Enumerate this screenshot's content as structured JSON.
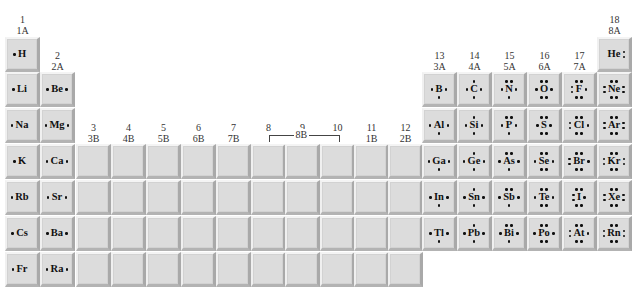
{
  "layout": {
    "col_x": [
      5,
      40,
      76,
      111,
      146,
      181,
      216,
      251,
      285,
      320,
      354,
      388,
      422,
      457,
      492,
      527,
      562,
      597
    ],
    "row_y": [
      37,
      72,
      108,
      144,
      180,
      216,
      252
    ],
    "tile_size": 35
  },
  "group_headers": [
    {
      "col": 0,
      "top": "1",
      "bottom": "1A",
      "y": 14
    },
    {
      "col": 1,
      "top": "2",
      "bottom": "2A",
      "y": 50
    },
    {
      "col": 2,
      "top": "3",
      "bottom": "3B",
      "y": 122
    },
    {
      "col": 3,
      "top": "4",
      "bottom": "4B",
      "y": 122
    },
    {
      "col": 4,
      "top": "5",
      "bottom": "5B",
      "y": 122
    },
    {
      "col": 5,
      "top": "6",
      "bottom": "6B",
      "y": 122
    },
    {
      "col": 6,
      "top": "7",
      "bottom": "7B",
      "y": 122
    },
    {
      "col": 7,
      "top": "8",
      "bottom": "",
      "y": 122
    },
    {
      "col": 8,
      "top": "9",
      "bottom": "",
      "y": 122
    },
    {
      "col": 9,
      "top": "10",
      "bottom": "",
      "y": 122
    },
    {
      "col": 10,
      "top": "11",
      "bottom": "1B",
      "y": 122
    },
    {
      "col": 11,
      "top": "12",
      "bottom": "2B",
      "y": 122
    },
    {
      "col": 12,
      "top": "13",
      "bottom": "3A",
      "y": 50
    },
    {
      "col": 13,
      "top": "14",
      "bottom": "4A",
      "y": 50
    },
    {
      "col": 14,
      "top": "15",
      "bottom": "5A",
      "y": 50
    },
    {
      "col": 15,
      "top": "16",
      "bottom": "6A",
      "y": 50
    },
    {
      "col": 16,
      "top": "17",
      "bottom": "7A",
      "y": 50
    },
    {
      "col": 17,
      "top": "18",
      "bottom": "8A",
      "y": 14
    }
  ],
  "group_8b_bracket": {
    "label": "8B",
    "from_col": 7,
    "to_col": 9
  },
  "elements": [
    {
      "symbol": "H",
      "col": 0,
      "row": 0,
      "dots": {
        "l": 1,
        "r": 0,
        "t": 0,
        "b": 0
      }
    },
    {
      "symbol": "He",
      "col": 17,
      "row": 0,
      "dots": {
        "l": 0,
        "r": 2,
        "t": 0,
        "b": 0
      }
    },
    {
      "symbol": "Li",
      "col": 0,
      "row": 1,
      "dots": {
        "l": 1,
        "r": 0,
        "t": 0,
        "b": 0
      }
    },
    {
      "symbol": "Be",
      "col": 1,
      "row": 1,
      "dots": {
        "l": 1,
        "r": 1,
        "t": 0,
        "b": 0
      }
    },
    {
      "symbol": "B",
      "col": 12,
      "row": 1,
      "dots": {
        "l": 1,
        "r": 1,
        "t": 0,
        "b": 1
      }
    },
    {
      "symbol": "C",
      "col": 13,
      "row": 1,
      "dots": {
        "l": 1,
        "r": 1,
        "t": 1,
        "b": 1
      }
    },
    {
      "symbol": "N",
      "col": 14,
      "row": 1,
      "dots": {
        "l": 1,
        "r": 1,
        "t": 2,
        "b": 1
      }
    },
    {
      "symbol": "O",
      "col": 15,
      "row": 1,
      "dots": {
        "l": 1,
        "r": 1,
        "t": 2,
        "b": 2
      }
    },
    {
      "symbol": "F",
      "col": 16,
      "row": 1,
      "dots": {
        "l": 2,
        "r": 1,
        "t": 2,
        "b": 2
      }
    },
    {
      "symbol": "Ne",
      "col": 17,
      "row": 1,
      "dots": {
        "l": 2,
        "r": 2,
        "t": 2,
        "b": 2
      }
    },
    {
      "symbol": "Na",
      "col": 0,
      "row": 2,
      "dots": {
        "l": 1,
        "r": 0,
        "t": 0,
        "b": 0
      }
    },
    {
      "symbol": "Mg",
      "col": 1,
      "row": 2,
      "dots": {
        "l": 1,
        "r": 1,
        "t": 0,
        "b": 0
      }
    },
    {
      "symbol": "Al",
      "col": 12,
      "row": 2,
      "dots": {
        "l": 1,
        "r": 1,
        "t": 0,
        "b": 1
      }
    },
    {
      "symbol": "Si",
      "col": 13,
      "row": 2,
      "dots": {
        "l": 1,
        "r": 1,
        "t": 1,
        "b": 1
      }
    },
    {
      "symbol": "P",
      "col": 14,
      "row": 2,
      "dots": {
        "l": 1,
        "r": 1,
        "t": 2,
        "b": 1
      }
    },
    {
      "symbol": "S",
      "col": 15,
      "row": 2,
      "dots": {
        "l": 1,
        "r": 1,
        "t": 2,
        "b": 2
      }
    },
    {
      "symbol": "Cl",
      "col": 16,
      "row": 2,
      "dots": {
        "l": 2,
        "r": 1,
        "t": 2,
        "b": 2
      }
    },
    {
      "symbol": "Ar",
      "col": 17,
      "row": 2,
      "dots": {
        "l": 2,
        "r": 2,
        "t": 2,
        "b": 2
      }
    },
    {
      "symbol": "K",
      "col": 0,
      "row": 3,
      "dots": {
        "l": 1,
        "r": 0,
        "t": 0,
        "b": 0
      }
    },
    {
      "symbol": "Ca",
      "col": 1,
      "row": 3,
      "dots": {
        "l": 1,
        "r": 1,
        "t": 0,
        "b": 0
      }
    },
    {
      "symbol": "Ga",
      "col": 12,
      "row": 3,
      "dots": {
        "l": 1,
        "r": 1,
        "t": 0,
        "b": 1
      }
    },
    {
      "symbol": "Ge",
      "col": 13,
      "row": 3,
      "dots": {
        "l": 1,
        "r": 1,
        "t": 1,
        "b": 1
      }
    },
    {
      "symbol": "As",
      "col": 14,
      "row": 3,
      "dots": {
        "l": 1,
        "r": 1,
        "t": 2,
        "b": 1
      }
    },
    {
      "symbol": "Se",
      "col": 15,
      "row": 3,
      "dots": {
        "l": 1,
        "r": 1,
        "t": 2,
        "b": 2
      }
    },
    {
      "symbol": "Br",
      "col": 16,
      "row": 3,
      "dots": {
        "l": 2,
        "r": 1,
        "t": 2,
        "b": 2
      }
    },
    {
      "symbol": "Kr",
      "col": 17,
      "row": 3,
      "dots": {
        "l": 2,
        "r": 2,
        "t": 2,
        "b": 2
      }
    },
    {
      "symbol": "Rb",
      "col": 0,
      "row": 4,
      "dots": {
        "l": 1,
        "r": 0,
        "t": 0,
        "b": 0
      }
    },
    {
      "symbol": "Sr",
      "col": 1,
      "row": 4,
      "dots": {
        "l": 1,
        "r": 1,
        "t": 0,
        "b": 0
      }
    },
    {
      "symbol": "In",
      "col": 12,
      "row": 4,
      "dots": {
        "l": 1,
        "r": 1,
        "t": 0,
        "b": 1
      }
    },
    {
      "symbol": "Sn",
      "col": 13,
      "row": 4,
      "dots": {
        "l": 1,
        "r": 1,
        "t": 1,
        "b": 1
      }
    },
    {
      "symbol": "Sb",
      "col": 14,
      "row": 4,
      "dots": {
        "l": 1,
        "r": 1,
        "t": 2,
        "b": 1
      }
    },
    {
      "symbol": "Te",
      "col": 15,
      "row": 4,
      "dots": {
        "l": 1,
        "r": 1,
        "t": 2,
        "b": 2
      }
    },
    {
      "symbol": "I",
      "col": 16,
      "row": 4,
      "dots": {
        "l": 2,
        "r": 1,
        "t": 2,
        "b": 2
      }
    },
    {
      "symbol": "Xe",
      "col": 17,
      "row": 4,
      "dots": {
        "l": 2,
        "r": 2,
        "t": 2,
        "b": 2
      }
    },
    {
      "symbol": "Cs",
      "col": 0,
      "row": 5,
      "dots": {
        "l": 1,
        "r": 0,
        "t": 0,
        "b": 0
      }
    },
    {
      "symbol": "Ba",
      "col": 1,
      "row": 5,
      "dots": {
        "l": 1,
        "r": 1,
        "t": 0,
        "b": 0
      }
    },
    {
      "symbol": "Tl",
      "col": 12,
      "row": 5,
      "dots": {
        "l": 1,
        "r": 1,
        "t": 0,
        "b": 1
      }
    },
    {
      "symbol": "Pb",
      "col": 13,
      "row": 5,
      "dots": {
        "l": 1,
        "r": 1,
        "t": 1,
        "b": 1
      }
    },
    {
      "symbol": "Bi",
      "col": 14,
      "row": 5,
      "dots": {
        "l": 1,
        "r": 1,
        "t": 2,
        "b": 1
      }
    },
    {
      "symbol": "Po",
      "col": 15,
      "row": 5,
      "dots": {
        "l": 1,
        "r": 1,
        "t": 2,
        "b": 2
      }
    },
    {
      "symbol": "At",
      "col": 16,
      "row": 5,
      "dots": {
        "l": 2,
        "r": 1,
        "t": 2,
        "b": 2
      }
    },
    {
      "symbol": "Rn",
      "col": 17,
      "row": 5,
      "dots": {
        "l": 2,
        "r": 2,
        "t": 2,
        "b": 2
      }
    },
    {
      "symbol": "Fr",
      "col": 0,
      "row": 6,
      "dots": {
        "l": 1,
        "r": 0,
        "t": 0,
        "b": 0
      }
    },
    {
      "symbol": "Ra",
      "col": 1,
      "row": 6,
      "dots": {
        "l": 1,
        "r": 1,
        "t": 0,
        "b": 0
      }
    }
  ],
  "blank_tiles": {
    "cols": [
      2,
      3,
      4,
      5,
      6,
      7,
      8,
      9,
      10,
      11
    ],
    "rows": [
      3,
      4,
      5,
      6
    ]
  }
}
